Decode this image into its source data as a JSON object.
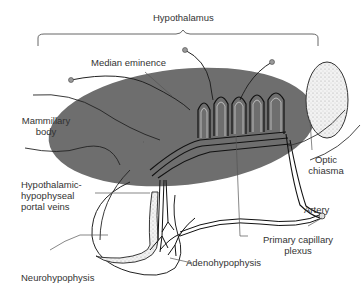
{
  "title": "Hypothalamus",
  "labels": {
    "hypothalamus": "Hypothalamus",
    "median_eminence": "Median eminence",
    "mammillary_body_1": "Mammillary",
    "mammillary_body_2": "body",
    "optic_chiasma_1": "Optic",
    "optic_chiasma_2": "chiasma",
    "portal_veins_1": "Hypothalamic-",
    "portal_veins_2": "hypophyseal",
    "portal_veins_3": "portal veins",
    "artery": "Artery",
    "primary_capillary_1": "Primary capillary",
    "primary_capillary_2": "plexus",
    "neurohypophysis": "Neurohypophysis",
    "adenohypophysis": "Adenohypophysis"
  },
  "colors": {
    "hypothalamus_fill": "#6e6e6e",
    "line": "#222222",
    "leader": "#555555",
    "chiasma_fill": "#ececec"
  }
}
